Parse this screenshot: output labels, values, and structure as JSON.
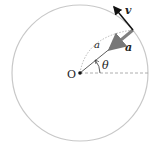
{
  "diagram": {
    "type": "circular-motion",
    "center": {
      "label": "O",
      "x": 80,
      "y": 73
    },
    "radius": 68,
    "labels": {
      "velocity": "v",
      "acceleration": "a",
      "radius": "a",
      "angle": "θ",
      "origin": "O"
    },
    "colors": {
      "circle": "#c8c8c8",
      "velocity_arrow": "#111111",
      "acceleration_arrow": "#808080",
      "radius_line": "#333333",
      "dashed": "#999999"
    }
  }
}
